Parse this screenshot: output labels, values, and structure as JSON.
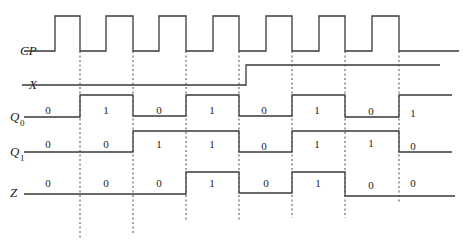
{
  "diagram": {
    "type": "timing-diagram",
    "signals": [
      {
        "name": "CP",
        "label": "CP",
        "subscript": ""
      },
      {
        "name": "X",
        "label": "X",
        "subscript": ""
      },
      {
        "name": "Q0",
        "label": "Q",
        "subscript": "0",
        "values": [
          "0",
          "1",
          "0",
          "1",
          "0",
          "1",
          "0",
          "1"
        ]
      },
      {
        "name": "Q1",
        "label": "Q",
        "subscript": "1",
        "values": [
          "0",
          "0",
          "1",
          "1",
          "0",
          "1",
          "1",
          "0"
        ]
      },
      {
        "name": "Z",
        "label": "Z",
        "subscript": "",
        "values": [
          "0",
          "0",
          "0",
          "1",
          "0",
          "1",
          "0",
          "0"
        ]
      }
    ],
    "clock_pulses": 7,
    "x_transition": "X goes high during the 4th clock interval"
  }
}
